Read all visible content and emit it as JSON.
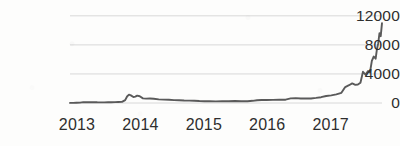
{
  "chart_data": {
    "type": "line",
    "title": "",
    "subtitle": "",
    "xlabel": "",
    "ylabel": "",
    "xlim": [
      2013.0,
      2017.92
    ],
    "ylim": [
      0,
      12800
    ],
    "grid": "horizontal",
    "legend": "none",
    "line_color": "#5a5a5a",
    "grid_color": "#d8d8d8",
    "background_color": "#fdfdfc",
    "text_color": "#2e2e2e",
    "y_ticks": [
      0,
      4000,
      8000,
      12000
    ],
    "y_tick_labels": [
      "0",
      "4000",
      "8000",
      "12000"
    ],
    "x_ticks": [
      2013,
      2014,
      2015,
      2016,
      2017
    ],
    "x_tick_labels": [
      "2013",
      "2014",
      "2015",
      "2016",
      "2017"
    ],
    "series": [
      {
        "name": "price",
        "x": [
          2013.0,
          2013.05,
          2013.1,
          2013.16,
          2013.21,
          2013.27,
          2013.32,
          2013.38,
          2013.43,
          2013.49,
          2013.54,
          2013.6,
          2013.65,
          2013.71,
          2013.76,
          2013.82,
          2013.87,
          2013.9,
          2013.93,
          2013.96,
          2014.0,
          2014.03,
          2014.06,
          2014.1,
          2014.15,
          2014.2,
          2014.26,
          2014.32,
          2014.4,
          2014.48,
          2014.56,
          2014.64,
          2014.72,
          2014.8,
          2014.88,
          2014.96,
          2015.04,
          2015.12,
          2015.2,
          2015.3,
          2015.4,
          2015.5,
          2015.6,
          2015.7,
          2015.8,
          2015.88,
          2015.95,
          2016.02,
          2016.1,
          2016.2,
          2016.3,
          2016.4,
          2016.48,
          2016.56,
          2016.64,
          2016.72,
          2016.8,
          2016.88,
          2016.96,
          2017.04,
          2017.12,
          2017.2,
          2017.28,
          2017.34,
          2017.4,
          2017.45,
          2017.5,
          2017.54,
          2017.58,
          2017.62,
          2017.66,
          2017.7,
          2017.73,
          2017.76,
          2017.79,
          2017.82,
          2017.84,
          2017.86,
          2017.88,
          2017.9,
          2017.92
        ],
        "y": [
          13,
          20,
          34,
          47,
          120,
          95,
          105,
          118,
          97,
          92,
          88,
          100,
          110,
          126,
          135,
          150,
          400,
          900,
          1150,
          1050,
          820,
          880,
          1020,
          930,
          640,
          600,
          620,
          580,
          500,
          460,
          440,
          400,
          380,
          340,
          330,
          310,
          265,
          240,
          235,
          225,
          240,
          250,
          265,
          240,
          250,
          300,
          370,
          420,
          415,
          430,
          450,
          455,
          640,
          670,
          610,
          620,
          620,
          700,
          800,
          960,
          1050,
          1180,
          1400,
          2200,
          2450,
          2700,
          2500,
          2550,
          2800,
          4300,
          3900,
          4400,
          4200,
          5800,
          6400,
          6100,
          7400,
          8200,
          9600,
          9200,
          11000
        ]
      }
    ],
    "annotations": []
  }
}
